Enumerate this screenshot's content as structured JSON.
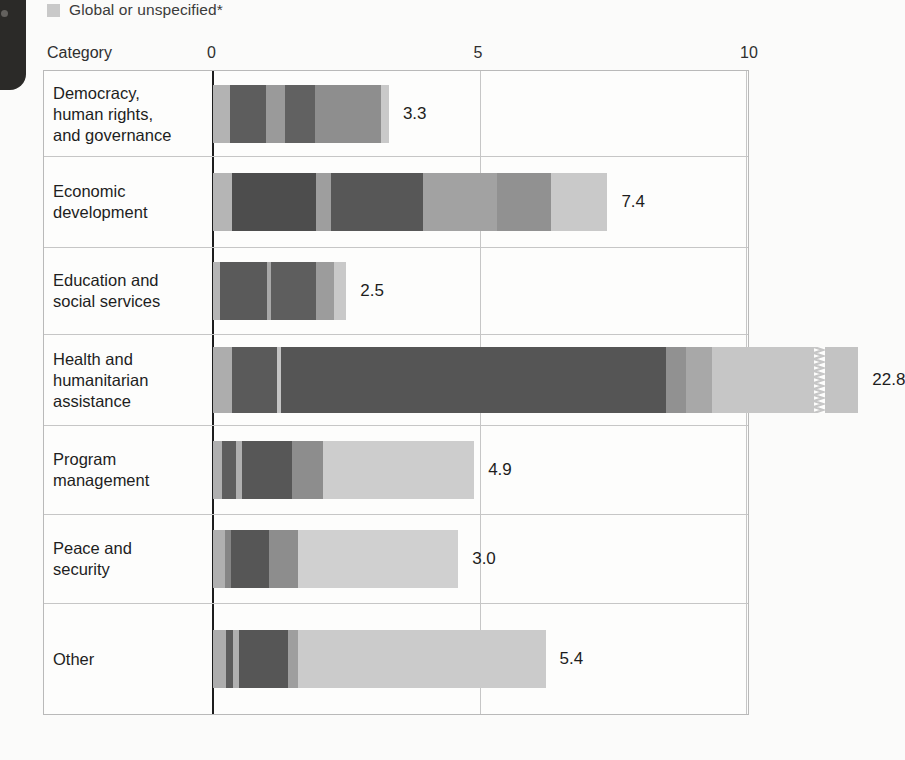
{
  "legend": {
    "items": [
      {
        "label": "Global or unspecified*",
        "color": "#c9c9c9",
        "icon": "legend-swatch"
      }
    ]
  },
  "axis": {
    "category_header": "Category",
    "ticks": [
      {
        "label": "0",
        "value": 0
      },
      {
        "label": "5",
        "value": 5
      },
      {
        "label": "10",
        "value": 10
      }
    ]
  },
  "chart_data": {
    "type": "bar",
    "orientation": "horizontal",
    "stacked": true,
    "title": "",
    "xlabel": "",
    "ylabel": "Category",
    "xlim": [
      0,
      10
    ],
    "xticks": [
      0,
      5,
      10
    ],
    "grid": true,
    "legend_position": "top-left",
    "legend_entries": [
      "Global or unspecified*"
    ],
    "note": "Health and humanitarian assistance bar is truncated with an axis-break marker; its full value is 22.8.",
    "categories": [
      "Democracy,\nhuman rights,\nand governance",
      "Economic\ndevelopment",
      "Education and\nsocial services",
      "Health and\nhumanitarian\nassistance",
      "Program\nmanagement",
      "Peace and\nsecurity",
      "Other"
    ],
    "values": [
      3.3,
      7.4,
      2.5,
      22.8,
      4.9,
      3.0,
      5.4
    ],
    "value_labels": [
      "3.3",
      "7.4",
      "2.5",
      "22.8",
      "4.9",
      "3.0",
      "5.4"
    ],
    "bars": [
      {
        "category": "Democracy, human rights, and governance",
        "total": 3.3,
        "label": "3.3",
        "broken": false,
        "segments": [
          {
            "width": 0.32,
            "color": "#b3b3b3"
          },
          {
            "width": 0.68,
            "color": "#5d5d5d"
          },
          {
            "width": 0.36,
            "color": "#9a9a9a"
          },
          {
            "width": 0.55,
            "color": "#616161"
          },
          {
            "width": 1.24,
            "color": "#8e8e8e"
          },
          {
            "width": 0.15,
            "color": "#c9c9c9"
          }
        ]
      },
      {
        "category": "Economic development",
        "total": 7.4,
        "label": "7.4",
        "broken": false,
        "segments": [
          {
            "width": 0.36,
            "color": "#b5b5b5"
          },
          {
            "width": 1.58,
            "color": "#4d4d4d"
          },
          {
            "width": 0.28,
            "color": "#9e9e9e"
          },
          {
            "width": 1.72,
            "color": "#575757"
          },
          {
            "width": 1.38,
            "color": "#a2a2a2"
          },
          {
            "width": 1.03,
            "color": "#919191"
          },
          {
            "width": 1.05,
            "color": "#c9c9c9"
          }
        ]
      },
      {
        "category": "Education and social services",
        "total": 2.5,
        "label": "2.5",
        "broken": false,
        "segments": [
          {
            "width": 0.14,
            "color": "#b5b5b5"
          },
          {
            "width": 0.88,
            "color": "#5a5a5a"
          },
          {
            "width": 0.06,
            "color": "#a8a8a8"
          },
          {
            "width": 0.86,
            "color": "#5e5e5e"
          },
          {
            "width": 0.33,
            "color": "#9c9c9c"
          },
          {
            "width": 0.23,
            "color": "#c9c9c9"
          }
        ]
      },
      {
        "category": "Health and humanitarian assistance",
        "total": 22.8,
        "label": "22.8",
        "broken": true,
        "segments": [
          {
            "width": 0.36,
            "color": "#adadad"
          },
          {
            "width": 0.84,
            "color": "#5a5a5a"
          },
          {
            "width": 0.07,
            "color": "#c4c4c4"
          },
          {
            "width": 7.23,
            "color": "#555555"
          },
          {
            "width": 0.38,
            "color": "#919191"
          },
          {
            "width": 0.48,
            "color": "#a8a8a8"
          },
          {
            "width": 1.92,
            "color": "#c6c6c6"
          }
        ],
        "after_break_segments": [
          {
            "width": 0.62,
            "color": "#c3c3c3"
          }
        ]
      },
      {
        "category": "Program management",
        "total": 4.9,
        "label": "4.9",
        "broken": false,
        "segments": [
          {
            "width": 0.17,
            "color": "#b0b0b0"
          },
          {
            "width": 0.26,
            "color": "#5e5e5e"
          },
          {
            "width": 0.12,
            "color": "#b0b0b0"
          },
          {
            "width": 0.94,
            "color": "#575757"
          },
          {
            "width": 0.58,
            "color": "#8d8d8d"
          },
          {
            "width": 2.83,
            "color": "#cdcdcd"
          }
        ]
      },
      {
        "category": "Peace and security",
        "total": 3.0,
        "label": "3.0",
        "broken": false,
        "segments": [
          {
            "width": 0.23,
            "color": "#b0b0b0"
          },
          {
            "width": 0.1,
            "color": "#858585"
          },
          {
            "width": 0.72,
            "color": "#565656"
          },
          {
            "width": 0.55,
            "color": "#8d8d8d"
          },
          {
            "width": 3.0,
            "color": "#d0d0d0"
          }
        ]
      },
      {
        "category": "Other",
        "total": 5.4,
        "label": "5.4",
        "broken": false,
        "segments": [
          {
            "width": 0.25,
            "color": "#adadad"
          },
          {
            "width": 0.12,
            "color": "#5c5c5c"
          },
          {
            "width": 0.11,
            "color": "#b0b0b0"
          },
          {
            "width": 0.93,
            "color": "#565656"
          },
          {
            "width": 0.18,
            "color": "#9e9e9e"
          },
          {
            "width": 4.65,
            "color": "#cbcbcb"
          }
        ]
      }
    ]
  }
}
